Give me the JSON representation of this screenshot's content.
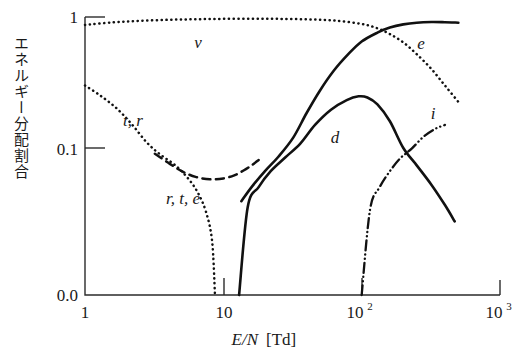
{
  "chart_data": {
    "type": "line",
    "title": "",
    "xlabel": "E/N [Td]",
    "ylabel": "エネルギー分配割合",
    "xscale": "log",
    "yscale": "log-ish",
    "xlim": [
      1,
      1000
    ],
    "ylim": [
      0.0,
      1.0
    ],
    "xticks": [
      "1",
      "10",
      "10",
      "10"
    ],
    "xtick_values": [
      1,
      10,
      100,
      1000
    ],
    "xtick_labels": [
      {
        "base": "1",
        "exp": ""
      },
      {
        "base": "10",
        "exp": ""
      },
      {
        "base": "10",
        "exp": "2"
      },
      {
        "base": "10",
        "exp": "3"
      }
    ],
    "yticks": [
      "1",
      "0.1",
      "0.0"
    ],
    "ytick_values": [
      1.0,
      0.1,
      0.0
    ],
    "grid": false,
    "legend": "inline-labels",
    "series": [
      {
        "name": "v",
        "label": "v",
        "style": "dotted",
        "description": "vibrational excitation fraction",
        "points": [
          [
            1,
            0.87
          ],
          [
            1.6,
            0.91
          ],
          [
            2.5,
            0.935
          ],
          [
            4,
            0.952
          ],
          [
            6.3,
            0.962
          ],
          [
            10,
            0.968
          ],
          [
            16,
            0.97
          ],
          [
            25,
            0.968
          ],
          [
            40,
            0.96
          ],
          [
            63,
            0.94
          ],
          [
            100,
            0.885
          ],
          [
            130,
            0.82
          ],
          [
            160,
            0.74
          ],
          [
            200,
            0.64
          ],
          [
            250,
            0.52
          ],
          [
            320,
            0.4
          ],
          [
            400,
            0.3
          ],
          [
            500,
            0.225
          ]
        ]
      },
      {
        "name": "t_r",
        "label": "t, r",
        "style": "dotted",
        "description": "translational and rotational fraction at low E/N",
        "points": [
          [
            1,
            0.3
          ],
          [
            1.3,
            0.25
          ],
          [
            1.7,
            0.2
          ],
          [
            2.2,
            0.15
          ],
          [
            2.8,
            0.11
          ],
          [
            3.5,
            0.08
          ],
          [
            4.5,
            0.055
          ],
          [
            5.5,
            0.036
          ],
          [
            6.5,
            0.022
          ],
          [
            7.5,
            0.011
          ],
          [
            8.3,
            0.004
          ],
          [
            8.7,
            0.0
          ]
        ]
      },
      {
        "name": "r_t_e",
        "label": "r, t, e",
        "style": "dashed",
        "description": "rotational, translational, elastic fraction minimum near 8 Td",
        "points": [
          [
            3.2,
            0.082
          ],
          [
            4.0,
            0.06
          ],
          [
            5.0,
            0.045
          ],
          [
            6.3,
            0.037
          ],
          [
            8.0,
            0.034
          ],
          [
            10,
            0.035
          ],
          [
            12,
            0.039
          ],
          [
            14,
            0.046
          ],
          [
            16,
            0.055
          ],
          [
            18,
            0.066
          ]
        ]
      },
      {
        "name": "e",
        "label": "e",
        "style": "solid",
        "description": "electronic excitation fraction, rises to plateau",
        "points": [
          [
            13.5,
            0.016
          ],
          [
            16,
            0.026
          ],
          [
            20,
            0.045
          ],
          [
            25,
            0.074
          ],
          [
            32,
            0.12
          ],
          [
            40,
            0.185
          ],
          [
            50,
            0.275
          ],
          [
            63,
            0.39
          ],
          [
            80,
            0.52
          ],
          [
            100,
            0.65
          ],
          [
            130,
            0.76
          ],
          [
            160,
            0.83
          ],
          [
            200,
            0.878
          ],
          [
            250,
            0.905
          ],
          [
            320,
            0.915
          ],
          [
            400,
            0.912
          ],
          [
            500,
            0.905
          ]
        ]
      },
      {
        "name": "d",
        "label": "d",
        "style": "solid",
        "description": "dissociation fraction, peaks near 100 Td then falls",
        "points": [
          [
            13.0,
            0.0
          ],
          [
            15,
            0.013
          ],
          [
            18,
            0.026
          ],
          [
            22,
            0.045
          ],
          [
            28,
            0.072
          ],
          [
            36,
            0.108
          ],
          [
            46,
            0.15
          ],
          [
            60,
            0.196
          ],
          [
            78,
            0.232
          ],
          [
            95,
            0.248
          ],
          [
            110,
            0.243
          ],
          [
            130,
            0.215
          ],
          [
            160,
            0.16
          ],
          [
            200,
            0.1
          ],
          [
            250,
            0.055
          ],
          [
            320,
            0.028
          ],
          [
            400,
            0.014
          ],
          [
            470,
            0.008
          ]
        ]
      },
      {
        "name": "i",
        "label": "i",
        "style": "dash-dot-dot",
        "description": "ionization fraction, rises from about 100 Td",
        "points": [
          [
            100,
            0.0
          ],
          [
            115,
            0.012
          ],
          [
            135,
            0.026
          ],
          [
            160,
            0.045
          ],
          [
            190,
            0.07
          ],
          [
            230,
            0.098
          ],
          [
            280,
            0.122
          ],
          [
            340,
            0.14
          ],
          [
            400,
            0.15
          ]
        ]
      }
    ],
    "annotations": [
      {
        "text": "v",
        "x_px": 198,
        "y_px": 48
      },
      {
        "text": "e",
        "x_px": 421,
        "y_px": 49
      },
      {
        "text": "i",
        "x_px": 433,
        "y_px": 119
      },
      {
        "text": "d",
        "x_px": 335,
        "y_px": 143
      },
      {
        "text": "t, r",
        "x_px": 133,
        "y_px": 126
      },
      {
        "text": "r, t, e",
        "x_px": 183,
        "y_px": 204
      }
    ]
  },
  "axes": {
    "x_title_italic": "E/N",
    "x_title_unit": "[Td]",
    "y_title": "エネルギー分配割合"
  },
  "colors": {
    "axis": "#2b2b2b",
    "curve": "#111111",
    "background": "#ffffff"
  }
}
